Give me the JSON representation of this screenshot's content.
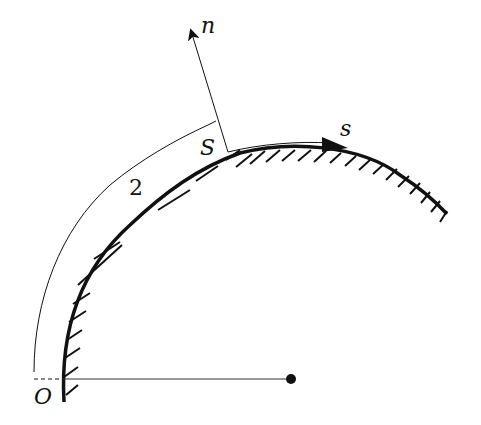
{
  "diagram": {
    "type": "boundary-layer curvilinear coordinates",
    "labels": {
      "normal_axis": "n",
      "tangent_axis": "s",
      "origin": "O",
      "point_S": "S",
      "region": "2"
    },
    "colors": {
      "ink": "#111111",
      "background": "#ffffff"
    },
    "geometry": {
      "center": [
        291,
        379
      ],
      "origin": [
        64,
        379
      ],
      "point_S": [
        228,
        152
      ],
      "n_arrow_tip": [
        190,
        25
      ]
    }
  }
}
